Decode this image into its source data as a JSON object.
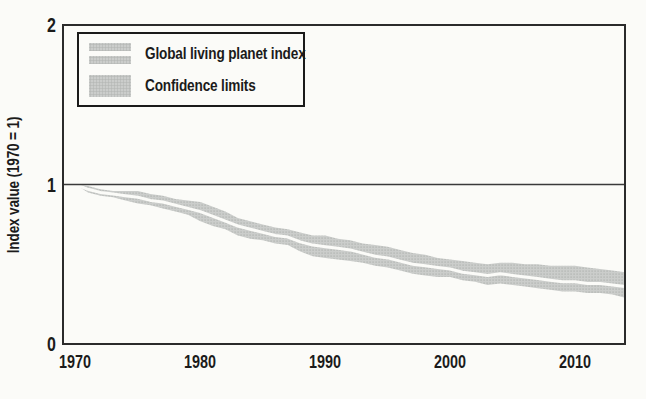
{
  "figure": {
    "y_axis_title": "Index value (1970 = 1)",
    "legend": {
      "items": [
        {
          "label": "Global living planet index",
          "swatch": "gray-band-with-white-line"
        },
        {
          "label": "Confidence limits",
          "swatch": "solid-gray-block"
        }
      ]
    },
    "colors": {
      "paper": "#fbfbf8",
      "axis": "#2b2b2b",
      "text": "#1b1b1b",
      "band_fill": "#cbcdcb",
      "band_dot": "#b7bab7",
      "index_line": "#fbfbf8",
      "reference_line": "#3a3a3a"
    }
  },
  "chart_data": {
    "type": "line",
    "title": "",
    "xlabel": "",
    "ylabel": "Index value (1970 = 1)",
    "x": [
      1970,
      1971,
      1972,
      1973,
      1974,
      1975,
      1976,
      1977,
      1978,
      1979,
      1980,
      1981,
      1982,
      1983,
      1984,
      1985,
      1986,
      1987,
      1988,
      1989,
      1990,
      1991,
      1992,
      1993,
      1994,
      1995,
      1996,
      1997,
      1998,
      1999,
      2000,
      2001,
      2002,
      2003,
      2004,
      2005,
      2006,
      2007,
      2008,
      2009,
      2010,
      2011,
      2012,
      2013,
      2014
    ],
    "series": [
      {
        "name": "Global living planet index",
        "values": [
          1.0,
          0.97,
          0.95,
          0.94,
          0.93,
          0.92,
          0.9,
          0.89,
          0.87,
          0.85,
          0.83,
          0.8,
          0.77,
          0.74,
          0.72,
          0.7,
          0.68,
          0.67,
          0.64,
          0.62,
          0.61,
          0.6,
          0.59,
          0.57,
          0.55,
          0.54,
          0.52,
          0.5,
          0.49,
          0.48,
          0.47,
          0.45,
          0.44,
          0.43,
          0.44,
          0.43,
          0.42,
          0.41,
          0.4,
          0.39,
          0.39,
          0.38,
          0.38,
          0.37,
          0.36
        ]
      },
      {
        "name": "Confidence limit (upper)",
        "values": [
          1.0,
          0.99,
          0.97,
          0.96,
          0.96,
          0.96,
          0.94,
          0.93,
          0.91,
          0.9,
          0.89,
          0.86,
          0.83,
          0.79,
          0.77,
          0.75,
          0.73,
          0.72,
          0.7,
          0.68,
          0.68,
          0.66,
          0.65,
          0.63,
          0.62,
          0.61,
          0.59,
          0.57,
          0.56,
          0.54,
          0.53,
          0.52,
          0.51,
          0.5,
          0.51,
          0.51,
          0.5,
          0.5,
          0.49,
          0.49,
          0.49,
          0.48,
          0.47,
          0.46,
          0.45
        ]
      },
      {
        "name": "Confidence limit (lower)",
        "values": [
          1.0,
          0.95,
          0.93,
          0.92,
          0.9,
          0.88,
          0.87,
          0.85,
          0.83,
          0.81,
          0.77,
          0.74,
          0.72,
          0.68,
          0.66,
          0.65,
          0.63,
          0.62,
          0.58,
          0.55,
          0.54,
          0.53,
          0.52,
          0.51,
          0.49,
          0.48,
          0.46,
          0.44,
          0.43,
          0.42,
          0.42,
          0.4,
          0.39,
          0.37,
          0.38,
          0.37,
          0.36,
          0.35,
          0.34,
          0.33,
          0.33,
          0.32,
          0.32,
          0.31,
          0.29
        ]
      }
    ],
    "xticks": [
      "1970",
      "1980",
      "1990",
      "2000",
      "2010"
    ],
    "yticks": [
      "0",
      "1",
      "2"
    ],
    "xlim": [
      1969,
      2014
    ],
    "ylim": [
      0,
      2
    ],
    "reference_line_y": 1,
    "legend_position": "top-left",
    "grid": false
  }
}
